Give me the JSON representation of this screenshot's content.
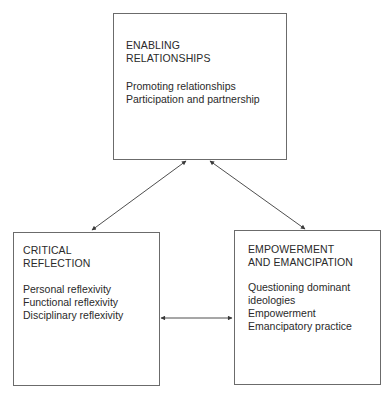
{
  "diagram": {
    "nodes": [
      {
        "id": "enabling",
        "title": "ENABLING\nRELATIONSHIPS",
        "items": [
          "Promoting relationships",
          "Participation and partnership"
        ]
      },
      {
        "id": "critical",
        "title": "CRITICAL\nREFLECTION",
        "items": [
          "Personal reflexivity",
          "Functional reflexivity",
          "Disciplinary reflexivity"
        ]
      },
      {
        "id": "empowerment",
        "title": "EMPOWERMENT\nAND EMANCIPATION",
        "items": [
          "Questioning dominant",
          "ideologies",
          "Empowerment",
          "Emancipatory practice"
        ]
      }
    ],
    "edges": [
      {
        "from": "enabling",
        "to": "critical",
        "type": "bidirectional"
      },
      {
        "from": "enabling",
        "to": "empowerment",
        "type": "bidirectional"
      },
      {
        "from": "critical",
        "to": "empowerment",
        "type": "bidirectional"
      }
    ],
    "colors": {
      "border": "#6b6b6b",
      "text": "#2a2a2a",
      "arrow": "#3a3a3a"
    }
  }
}
